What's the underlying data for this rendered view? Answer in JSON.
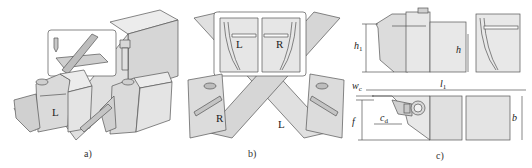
{
  "figure": {
    "panels": [
      {
        "id": "a",
        "caption": "a)",
        "hand_labels": [
          "L"
        ]
      },
      {
        "id": "b",
        "caption": "b)",
        "inset_labels": [
          "L",
          "R"
        ],
        "holder_labels": [
          "R",
          "L"
        ]
      },
      {
        "id": "c",
        "caption": "c)"
      }
    ],
    "dimensions": {
      "h1": {
        "symbol": "h",
        "sub": "1"
      },
      "h": {
        "symbol": "h"
      },
      "l1": {
        "symbol": "l",
        "sub": "1"
      },
      "wc": {
        "symbol": "w",
        "sub": "c"
      },
      "f": {
        "symbol": "f"
      },
      "cd": {
        "symbol": "c",
        "sub": "d"
      },
      "b": {
        "symbol": "b"
      }
    },
    "colors": {
      "line": "#555555",
      "fill_light": "#e4e4e4",
      "fill_mid": "#d2d2d2",
      "fill_dark": "#bdbdbd",
      "background": "#ffffff"
    }
  }
}
